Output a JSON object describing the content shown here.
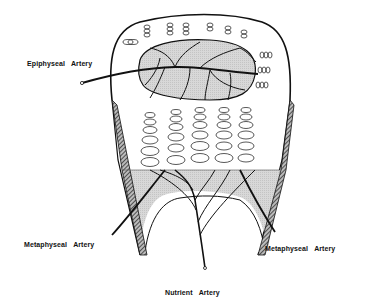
{
  "diagram": {
    "labels": {
      "epiphyseal": {
        "word1": "Epiphyseal",
        "word2": "Artery"
      },
      "metaphyseal_left": {
        "word1": "Metaphyseal",
        "word2": "Artery"
      },
      "metaphyseal_right": {
        "word1": "Metaphyseal",
        "word2": "Artery"
      },
      "nutrient": {
        "word1": "Nutrient",
        "word2": "Artery"
      }
    },
    "colors": {
      "background": "#ffffff",
      "line": "#111111",
      "shade": "#d4d4d4",
      "cortex_hatch": "#555555"
    }
  }
}
